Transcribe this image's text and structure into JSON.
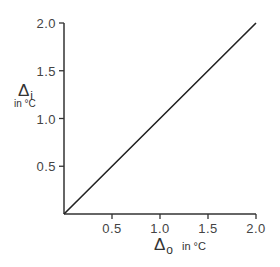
{
  "chart_data": {
    "type": "line",
    "title": "",
    "xlabel": "Δo in °C",
    "ylabel": "Δi in °C",
    "xlabel_parts": {
      "symbol": "Δ",
      "subscript": "o",
      "unit": "in °C"
    },
    "ylabel_parts": {
      "symbol": "Δ",
      "subscript": "i",
      "unit": "in °C"
    },
    "xlim": [
      0,
      2.0
    ],
    "ylim": [
      0,
      2.0
    ],
    "x_ticks": [
      "0.5",
      "1.0",
      "1.5",
      "2.0"
    ],
    "y_ticks": [
      "0.5",
      "1.0",
      "1.5",
      "2.0"
    ],
    "x_tick_values": [
      0.5,
      1.0,
      1.5,
      2.0
    ],
    "y_tick_values": [
      0.5,
      1.0,
      1.5,
      2.0
    ],
    "grid": false,
    "legend": null,
    "series": [
      {
        "name": "Δi vs Δo",
        "x": [
          0,
          0.5,
          1.0,
          1.5,
          2.0
        ],
        "y": [
          0,
          0.5,
          1.0,
          1.5,
          2.0
        ]
      }
    ]
  },
  "colors": {
    "axis": "#333333",
    "line": "#222222",
    "text": "#444444"
  }
}
